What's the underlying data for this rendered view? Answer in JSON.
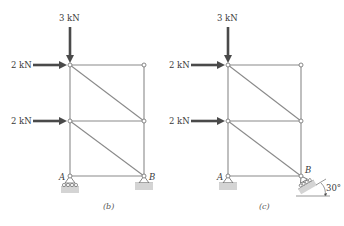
{
  "figures": [
    {
      "id": "b",
      "caption": "(b)",
      "loads": [
        {
          "label": "3 kN",
          "direction": "down",
          "at": "top-left joint"
        },
        {
          "label": "2 kN",
          "direction": "right",
          "at": "top-left joint"
        },
        {
          "label": "2 kN",
          "direction": "right",
          "at": "middle-left joint"
        }
      ],
      "supports": [
        {
          "label": "A",
          "type": "roller"
        },
        {
          "label": "B",
          "type": "pin"
        }
      ]
    },
    {
      "id": "c",
      "caption": "(c)",
      "loads": [
        {
          "label": "3 kN",
          "direction": "down",
          "at": "top-left joint"
        },
        {
          "label": "2 kN",
          "direction": "right",
          "at": "top-left joint"
        },
        {
          "label": "2 kN",
          "direction": "right",
          "at": "middle-left joint"
        }
      ],
      "supports": [
        {
          "label": "A",
          "type": "pin"
        },
        {
          "label": "B",
          "type": "inclined roller"
        }
      ],
      "angle_label": "30°"
    }
  ]
}
